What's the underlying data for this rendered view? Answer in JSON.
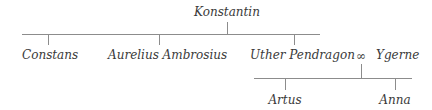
{
  "diagram": {
    "type": "family-tree",
    "root": {
      "name": "Konstantin"
    },
    "generation_2": [
      {
        "name": "Constans"
      },
      {
        "name": "Aurelius Ambrosius"
      },
      {
        "name": "Uther Pendragon"
      }
    ],
    "marriage": {
      "symbol": "∞",
      "spouse_a": "Uther Pendragon",
      "spouse_b": "Ygerne"
    },
    "spouse": {
      "name": "Ygerne"
    },
    "generation_3": [
      {
        "name": "Artus"
      },
      {
        "name": "Anna"
      }
    ],
    "line_color": "#8c8c8c",
    "text_color": "#3a3a3a"
  }
}
